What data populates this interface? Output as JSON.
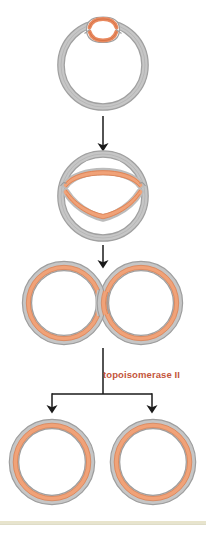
{
  "figure": {
    "title": "",
    "background_color": "#ffffff"
  },
  "colors": {
    "dna_outer_gray": "#9a9a9a",
    "dna_outer_gray_light": "#bdbdbd",
    "dna_fill_gray": "#c9c9c9",
    "dna_orange": "#e8895f",
    "dna_orange_fill": "#f0a278",
    "arrow_black": "#1a1a1a",
    "label_orange": "#c4553b",
    "footer_band": "#e8e4cc"
  },
  "labels": {
    "enzyme": "topoisomerase II"
  },
  "stages": [
    {
      "id": "stage-1",
      "name": "replication-bubble-circle",
      "description": "Circular DNA with small replication bubble at top",
      "center": {
        "x": 103,
        "y": 65
      },
      "radius": 42
    },
    {
      "id": "stage-2",
      "name": "theta-structure",
      "description": "Partially replicated circular DNA forming theta structure",
      "center": {
        "x": 103,
        "y": 196
      },
      "radius": 42
    },
    {
      "id": "stage-3",
      "name": "catenated-daughter-circles",
      "description": "Two interlocked (catenated) daughter DNA circles",
      "left_center": {
        "x": 64,
        "y": 303
      },
      "right_center": {
        "x": 141,
        "y": 303
      },
      "radius": 42
    },
    {
      "id": "stage-4",
      "name": "separated-daughter-circles",
      "description": "Two decatenated, fully separated daughter DNA circles",
      "left_center": {
        "x": 52,
        "y": 460
      },
      "right_center": {
        "x": 152,
        "y": 460
      },
      "radius": 44
    }
  ],
  "arrows": [
    {
      "id": "arrow-1",
      "name": "arrow-stage1-to-stage2",
      "from_y": 115,
      "to_y": 150,
      "x": 103
    },
    {
      "id": "arrow-2",
      "name": "arrow-stage2-to-stage3",
      "from_y": 243,
      "to_y": 262,
      "x": 103
    },
    {
      "id": "arrow-3",
      "name": "branching-arrow-topoisomerase",
      "stem_x": 103,
      "stem_from_y": 348,
      "stem_to_y": 394,
      "left_x": 52,
      "right_x": 152,
      "head_y": 412
    }
  ]
}
